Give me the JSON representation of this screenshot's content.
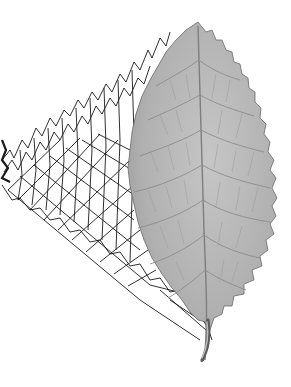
{
  "figure": {
    "background_color": "#ffffff",
    "leaf": {
      "fill_color": "#b4b4b4",
      "vein_color": "#8a8a8a",
      "edge_color": "#555555",
      "shape": "ovate-serrate",
      "has_petiole": true
    },
    "mesh": {
      "line_color": "#1a1a1a",
      "style": "wireframe"
    }
  }
}
